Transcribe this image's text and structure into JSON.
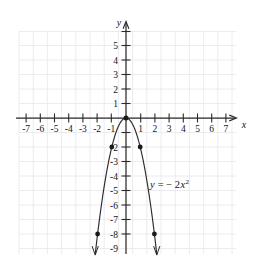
{
  "figure": {
    "caption_fragment": "",
    "x_axis": {
      "name": "x",
      "tick_labels": [
        "-7",
        "-6",
        "-5",
        "-4",
        "-3",
        "-2",
        "-1",
        "1",
        "2",
        "3",
        "4",
        "5",
        "6",
        "7"
      ],
      "tick_values": [
        -7,
        -6,
        -5,
        -4,
        -3,
        -2,
        -1,
        1,
        2,
        3,
        4,
        5,
        6,
        7
      ],
      "range": [
        -7.6,
        7.9
      ]
    },
    "y_axis": {
      "name": "y",
      "tick_labels": [
        "5",
        "4",
        "3",
        "2",
        "1",
        "-2",
        "-3",
        "-4",
        "-5",
        "-6",
        "-7",
        "-8",
        "-9"
      ],
      "tick_values": [
        5,
        4,
        3,
        2,
        1,
        -2,
        -3,
        -4,
        -5,
        -6,
        -7,
        -8,
        -9
      ],
      "range": [
        -9.4,
        6.0
      ]
    },
    "equation_label": {
      "lead": "y",
      "equals": "= − 2",
      "variable": "x",
      "exponent": "2",
      "full": "y = − 2x²"
    },
    "grid": {
      "visible": true,
      "color": "#e6e6ea",
      "x_min": -7.6,
      "x_max": 7.9,
      "y_min": -9.4,
      "y_max": 6.0
    },
    "axis_color": "#2b2b2b",
    "curve_color": "#2b2b2b",
    "point_color": "#1a1a1a"
  },
  "chart_data": {
    "type": "line",
    "title": "",
    "subtitle": "",
    "xlabel": "x",
    "ylabel": "y",
    "xlim": [
      -7.6,
      7.9
    ],
    "ylim": [
      -9.4,
      6.0
    ],
    "grid": true,
    "legend": "none",
    "annotations": [
      "y = − 2x²"
    ],
    "xticks": [
      -7,
      -6,
      -5,
      -4,
      -3,
      -2,
      -1,
      1,
      2,
      3,
      4,
      5,
      6,
      7
    ],
    "yticks": [
      5,
      4,
      3,
      2,
      1,
      -2,
      -3,
      -4,
      -5,
      -6,
      -7,
      -8,
      -9
    ],
    "series": [
      {
        "name": "y = -2x^2",
        "equation": "y = -2*x^2",
        "coefficient": -2,
        "vertex": [
          0,
          0
        ],
        "opens": "down",
        "marked_points": [
          {
            "x": -2,
            "y": -8
          },
          {
            "x": -1,
            "y": -2
          },
          {
            "x": 0,
            "y": 0
          },
          {
            "x": 1,
            "y": -2
          },
          {
            "x": 2,
            "y": -8
          }
        ],
        "x": [
          -2.2,
          -2.0,
          -1.75,
          -1.5,
          -1.25,
          -1.0,
          -0.75,
          -0.5,
          -0.25,
          0,
          0.25,
          0.5,
          0.75,
          1.0,
          1.25,
          1.5,
          1.75,
          2.0,
          2.2
        ],
        "values": [
          -9.68,
          -8.0,
          -6.125,
          -4.5,
          -3.125,
          -2.0,
          -1.125,
          -0.5,
          -0.125,
          0,
          -0.125,
          -0.5,
          -1.125,
          -2.0,
          -3.125,
          -4.5,
          -6.125,
          -8.0,
          -9.68
        ],
        "arrow_ends": [
          "both"
        ]
      }
    ]
  }
}
